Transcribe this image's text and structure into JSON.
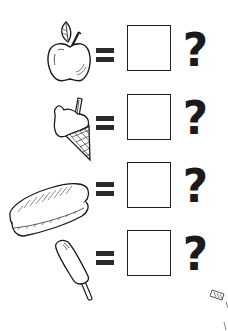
{
  "worksheet": {
    "colors": {
      "ink": "#1a1a1a",
      "equals": "#2b2b2b",
      "box_border": "#1e1e1e",
      "background": "#ffffff"
    },
    "rows": [
      {
        "item": "apple",
        "icon": "apple-icon",
        "operator": "=",
        "answer": "",
        "prompt": "?"
      },
      {
        "item": "ice cream cone",
        "icon": "ice-cream-cone-icon",
        "operator": "=",
        "answer": "",
        "prompt": "?"
      },
      {
        "item": "hot dog",
        "icon": "hot-dog-icon",
        "operator": "=",
        "answer": "",
        "prompt": "?"
      },
      {
        "item": "popsicle",
        "icon": "popsicle-icon",
        "operator": "=",
        "answer": "",
        "prompt": "?"
      }
    ]
  }
}
